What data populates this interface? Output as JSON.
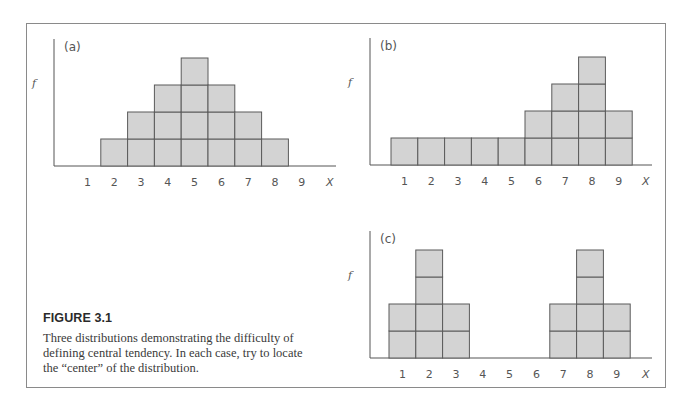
{
  "figure": {
    "title": "FIGURE 3.1",
    "caption": "Three distributions demonstrating the difficulty of defining central tendency. In each case, try to locate the “center” of the distribution."
  },
  "chart_data": [
    {
      "type": "bar",
      "panel_label": "(a)",
      "title": "",
      "xlabel": "X",
      "ylabel": "f",
      "categories": [
        "1",
        "2",
        "3",
        "4",
        "5",
        "6",
        "7",
        "8",
        "9"
      ],
      "values": [
        0,
        1,
        2,
        3,
        4,
        3,
        2,
        1,
        0
      ],
      "ylim": [
        0,
        4
      ],
      "grid": false,
      "note": "Histogram drawn as stacked unit blocks"
    },
    {
      "type": "bar",
      "panel_label": "(b)",
      "title": "",
      "xlabel": "X",
      "ylabel": "f",
      "categories": [
        "1",
        "2",
        "3",
        "4",
        "5",
        "6",
        "7",
        "8",
        "9"
      ],
      "values": [
        1,
        1,
        1,
        1,
        1,
        2,
        3,
        4,
        2
      ],
      "ylim": [
        0,
        4
      ],
      "grid": false,
      "note": "Histogram drawn as stacked unit blocks"
    },
    {
      "type": "bar",
      "panel_label": "(c)",
      "title": "",
      "xlabel": "X",
      "ylabel": "f",
      "categories": [
        "1",
        "2",
        "3",
        "4",
        "5",
        "6",
        "7",
        "8",
        "9"
      ],
      "values": [
        2,
        4,
        2,
        0,
        0,
        0,
        2,
        4,
        2
      ],
      "ylim": [
        0,
        4
      ],
      "grid": false,
      "note": "Histogram drawn as stacked unit blocks"
    }
  ],
  "colors": {
    "bar_fill": "#d3d3d3",
    "bar_stroke": "#5a5a5a",
    "axis": "#555555",
    "frame": "#8a8a8a"
  }
}
